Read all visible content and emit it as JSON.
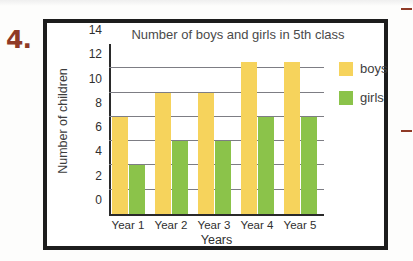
{
  "question_number": "4.",
  "accent_color": "#8f3a26",
  "frame_color": "#1d1d1d",
  "chart_data": {
    "type": "bar",
    "title": "Number of boys and girls in 5th class",
    "xlabel": "Years",
    "ylabel": "Number of children",
    "categories": [
      "Year 1",
      "Year 2",
      "Year 3",
      "Year 4",
      "Year 5"
    ],
    "yticks": [
      "0",
      "2",
      "4",
      "6",
      "8",
      "10",
      "12",
      "14"
    ],
    "ylim": [
      0,
      14
    ],
    "grid": true,
    "gridlines_at": [
      2,
      4,
      6,
      8,
      10,
      12
    ],
    "legend_position": "right",
    "series": [
      {
        "name": "boys",
        "color": "#f6d35c",
        "values": [
          8,
          10,
          10,
          12.5,
          12.5
        ]
      },
      {
        "name": "girls",
        "color": "#8bc34a",
        "values": [
          4,
          6,
          6,
          8,
          8
        ]
      }
    ]
  },
  "legend": {
    "items": [
      {
        "label": "boys",
        "color": "#f6d35c"
      },
      {
        "label": "girls",
        "color": "#8bc34a"
      }
    ]
  },
  "edge_marks": [
    {
      "name": "top-dash"
    },
    {
      "name": "middle-dash"
    }
  ]
}
